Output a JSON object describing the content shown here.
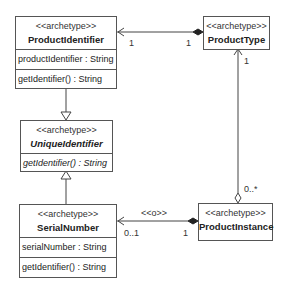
{
  "classes": {
    "product_identifier": {
      "stereotype": "<<archetype>>",
      "name": "ProductIdentifier",
      "attribute": "productIdentifier : String",
      "operation": "getIdentifier() : String"
    },
    "product_type": {
      "stereotype": "<<archetype>>",
      "name": "ProductType"
    },
    "unique_identifier": {
      "stereotype": "<<archetype>>",
      "name": "UniqueIdentifier",
      "operation": "getIdentifier() : String"
    },
    "serial_number": {
      "stereotype": "<<archetype>>",
      "name": "SerialNumber",
      "attribute": "serialNumber : String",
      "operation": "getIdentifier() : String"
    },
    "product_instance": {
      "stereotype": "<<archetype>>",
      "name": "ProductInstance"
    }
  },
  "associations": {
    "type_identifier": {
      "left_mult": "1",
      "right_mult": "1"
    },
    "type_instance": {
      "top_mult": "1",
      "bottom_mult": "0..*"
    },
    "instance_serial": {
      "stereotype": "<<o>>",
      "left_mult": "0..1",
      "right_mult": "1"
    }
  },
  "colors": {
    "line": "#444444",
    "border": "#555555",
    "background": "#ffffff"
  }
}
